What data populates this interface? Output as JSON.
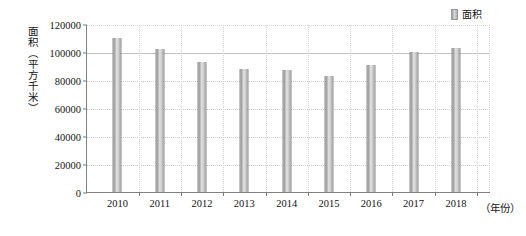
{
  "chart_data": {
    "type": "bar",
    "title": "",
    "subtitle": "",
    "xlabel": "（年份）",
    "ylabel": "面积（平方千米）",
    "categories": [
      "2010",
      "2011",
      "2012",
      "2013",
      "2014",
      "2015",
      "2016",
      "2017",
      "2018"
    ],
    "values": [
      110000,
      102000,
      93000,
      88000,
      87000,
      83000,
      91000,
      100000,
      103000
    ],
    "series": [
      {
        "name": "面积",
        "values": [
          110000,
          102000,
          93000,
          88000,
          87000,
          83000,
          91000,
          100000,
          103000
        ]
      }
    ],
    "ylim": [
      0,
      120000
    ],
    "ytick_labels": [
      "0",
      "20000",
      "40000",
      "60000",
      "80000",
      "100000",
      "120000"
    ],
    "ytick_values": [
      0,
      20000,
      40000,
      60000,
      80000,
      100000,
      120000
    ],
    "grid": true,
    "legend": {
      "position": "top-right",
      "entries": [
        "面积"
      ]
    },
    "bar_color": "#c9c9c9",
    "grid_color": "#c9c9c9",
    "axis_color": "#808080"
  },
  "legend": {
    "label": "面积"
  },
  "axes": {
    "y_title": "面积（平方千米）",
    "x_unit": "（年份）"
  }
}
